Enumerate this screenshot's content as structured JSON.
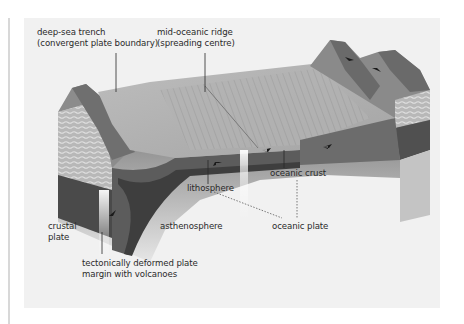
{
  "figure": {
    "labels": {
      "trench_line1": "deep-sea trench",
      "trench_line2": "(convergent plate boundary)",
      "ridge_line1": "mid-oceanic ridge",
      "ridge_line2": "(spreading centre)",
      "lithosphere": "lithosphere",
      "oceanic_crust": "oceanic crust",
      "crustal_line1": "crustal",
      "crustal_line2": "plate",
      "asthenosphere": "asthenosphere",
      "oceanic_plate": "oceanic plate",
      "deformed_line1": "tectonically deformed plate",
      "deformed_line2": "margin with volcanoes"
    },
    "colors": {
      "panel_bg": "#f1f1f1",
      "label_text": "#2a2a2a",
      "arrow": "#1a1a1a"
    }
  }
}
